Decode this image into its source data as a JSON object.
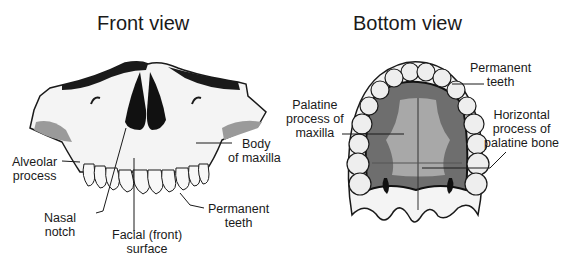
{
  "front_view": {
    "title": "Front view",
    "labels": {
      "alveolar_1": "Alveolar",
      "alveolar_2": "process",
      "body_1": "Body",
      "body_2": "of maxilla",
      "nasal_1": "Nasal",
      "nasal_2": "notch",
      "facial_1": "Facial (front)",
      "facial_2": "surface",
      "perm_1": "Permanent",
      "perm_2": "teeth"
    }
  },
  "bottom_view": {
    "title": "Bottom view",
    "labels": {
      "perm_1": "Permanent",
      "perm_2": "teeth",
      "palatine_1": "Palatine",
      "palatine_2": "process of",
      "palatine_3": "maxilla",
      "horiz_1": "Horizontal",
      "horiz_2": "process of",
      "horiz_3": "palatine bone"
    }
  },
  "colors": {
    "bone": "#f4f4f4",
    "outline": "#1a1a1a",
    "shade": "#9a9a9a",
    "palate_dark": "#6e6e6e",
    "palate_light": "#a8a8a8"
  }
}
